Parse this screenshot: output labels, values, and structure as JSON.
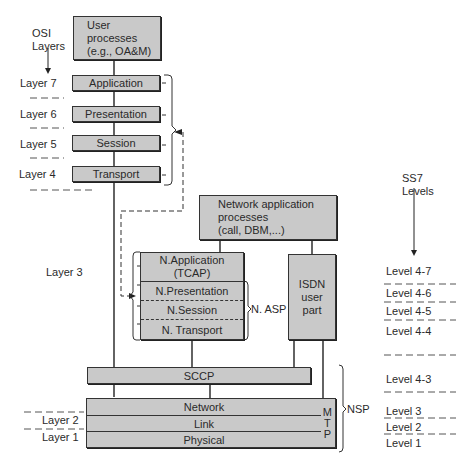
{
  "osi_header": "OSI\nLayers",
  "ss7_header": "SS7\nLevels",
  "user_processes": "User\nprocesses\n(e.g., OA&M)",
  "osi_stack": [
    {
      "layer": "Layer 7",
      "box": "Application"
    },
    {
      "layer": "Layer 6",
      "box": "Presentation"
    },
    {
      "layer": "Layer 5",
      "box": "Session"
    },
    {
      "layer": "Layer 4",
      "box": "Transport"
    }
  ],
  "layer3": "Layer 3",
  "layer2": "Layer 2",
  "layer1": "Layer 1",
  "network_app_processes": "Network application\nprocesses\n(call, DBM,...)",
  "asp": {
    "application": "N.Application\n(TCAP)",
    "presentation": "N.Presentation",
    "session": "N.Session",
    "transport": "N. Transport",
    "bracket_label": "N. ASP"
  },
  "isdn": "ISDN\nuser\npart",
  "sccp": "SCCP",
  "mtp": {
    "network": "Network",
    "link": "Link",
    "physical": "Physical",
    "side_label": "M\nT\nP"
  },
  "nsp_label": "NSP",
  "ss7_levels": [
    "Level 4-7",
    "Level 4-6",
    "Level 4-5",
    "Level 4-4",
    "Level 4-3",
    "Level 3",
    "Level 2",
    "Level 1"
  ]
}
